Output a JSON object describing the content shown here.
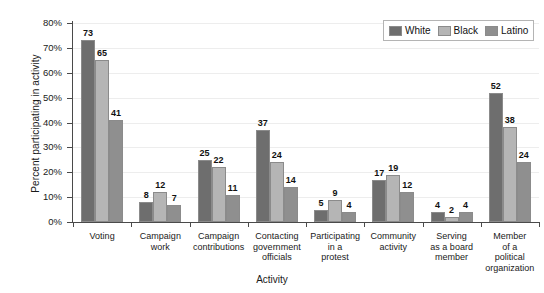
{
  "chart_data": {
    "type": "bar",
    "title": "",
    "xlabel": "Activity",
    "ylabel": "Percent participating in activity",
    "ylim": [
      0,
      80
    ],
    "ytick_labels": [
      "0%",
      "10%",
      "20%",
      "30%",
      "40%",
      "50%",
      "60%",
      "70%",
      "80%"
    ],
    "ytick_values": [
      0,
      10,
      20,
      30,
      40,
      50,
      60,
      70,
      80
    ],
    "grid": true,
    "legend_position": "top-right",
    "categories": [
      "Voting",
      "Campaign work",
      "Campaign contributions",
      "Contacting government officials",
      "Participating in a protest",
      "Community activity",
      "Serving as a board member",
      "Member of a political organization"
    ],
    "category_lines": [
      [
        "Voting"
      ],
      [
        "Campaign",
        "work"
      ],
      [
        "Campaign",
        "contributions"
      ],
      [
        "Contacting",
        "government",
        "officials"
      ],
      [
        "Participating",
        "in a",
        "protest"
      ],
      [
        "Community",
        "activity"
      ],
      [
        "Serving",
        "as a board",
        "member"
      ],
      [
        "Member",
        "of a",
        "political",
        "organization"
      ]
    ],
    "series": [
      {
        "name": "White",
        "color": "#6e6e6e",
        "values": [
          73,
          8,
          25,
          37,
          5,
          17,
          4,
          52
        ]
      },
      {
        "name": "Black",
        "color": "#b5b5b5",
        "values": [
          65,
          12,
          22,
          24,
          9,
          19,
          2,
          38
        ]
      },
      {
        "name": "Latino",
        "color": "#8f8f8f",
        "values": [
          41,
          7,
          11,
          14,
          4,
          12,
          4,
          24
        ]
      }
    ]
  }
}
